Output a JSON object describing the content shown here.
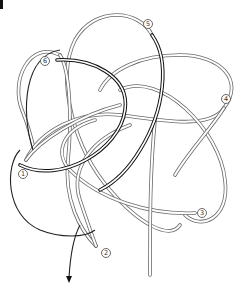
{
  "figure": {
    "panel_marker": "",
    "labels": [
      {
        "id": "1",
        "text": "1",
        "x": 23,
        "y": 174
      },
      {
        "id": "2",
        "text": "2",
        "x": 106,
        "y": 253
      },
      {
        "id": "3",
        "text": "3",
        "x": 202,
        "y": 213
      },
      {
        "id": "4",
        "text": "4",
        "x": 226,
        "y": 99
      },
      {
        "id": "5",
        "text": "5",
        "x": 148,
        "y": 24
      },
      {
        "id": "6",
        "text": "6",
        "x": 45,
        "y": 61
      }
    ],
    "arrow": {
      "direction": "down",
      "x": 69,
      "y": 281
    }
  }
}
